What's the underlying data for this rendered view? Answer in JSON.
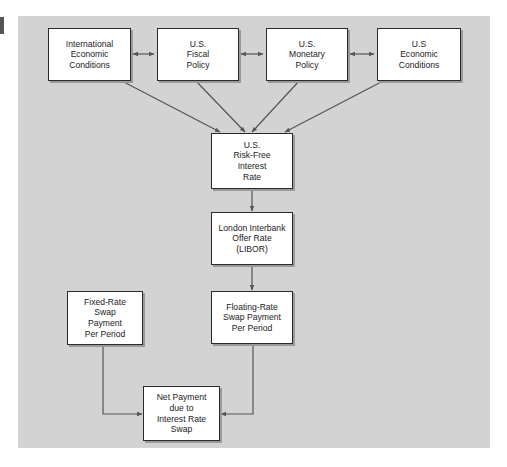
{
  "diagram": {
    "colors": {
      "panel": "#d3d3d3",
      "node_fill": "#ffffff",
      "node_border": "#2a2a2a",
      "edge": "#555555"
    },
    "nodes": {
      "international": {
        "label": "International\nEconomic\nConditions"
      },
      "fiscal": {
        "label": "U.S.\nFiscal\nPolicy"
      },
      "monetary": {
        "label": "U.S.\nMonetary\nPolicy"
      },
      "economic": {
        "label": "U.S\nEconomic\nConditions"
      },
      "risk_free": {
        "label": "U.S.\nRisk-Free\nInterest\nRate"
      },
      "libor": {
        "label": "London Interbank\nOffer Rate\n(LIBOR)"
      },
      "fixed": {
        "label": "Fixed-Rate\nSwap\nPayment\nPer Period"
      },
      "floating": {
        "label": "Floating-Rate\nSwap Payment\nPer Period"
      },
      "net": {
        "label": "Net Payment\ndue to\nInterest Rate\nSwap"
      }
    },
    "edges": [
      {
        "from": "international",
        "to": "fiscal",
        "type": "bidirectional"
      },
      {
        "from": "fiscal",
        "to": "monetary",
        "type": "bidirectional"
      },
      {
        "from": "monetary",
        "to": "economic",
        "type": "bidirectional"
      },
      {
        "from": "international",
        "to": "risk_free",
        "type": "directed"
      },
      {
        "from": "fiscal",
        "to": "risk_free",
        "type": "directed"
      },
      {
        "from": "monetary",
        "to": "risk_free",
        "type": "directed"
      },
      {
        "from": "economic",
        "to": "risk_free",
        "type": "directed"
      },
      {
        "from": "risk_free",
        "to": "libor",
        "type": "directed"
      },
      {
        "from": "libor",
        "to": "floating",
        "type": "directed"
      },
      {
        "from": "fixed",
        "to": "net",
        "type": "directed"
      },
      {
        "from": "floating",
        "to": "net",
        "type": "directed"
      }
    ]
  }
}
